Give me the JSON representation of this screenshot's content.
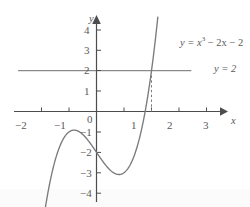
{
  "figure": {
    "background_color": "#ffffff",
    "ink_color": "#59595b",
    "curve_color": "#7b7b7d",
    "line_color": "#6e6e70"
  },
  "axes": {
    "x_axis_label": "x",
    "y_axis_label": "y",
    "x_ticks": [
      {
        "label": "−2",
        "value": -2
      },
      {
        "label": "−1",
        "value": -1
      },
      {
        "label": "1",
        "value": 1
      },
      {
        "label": "2",
        "value": 2
      },
      {
        "label": "3",
        "value": 3
      }
    ],
    "y_ticks": [
      {
        "label": "4",
        "value": 4
      },
      {
        "label": "3",
        "value": 3
      },
      {
        "label": "2",
        "value": 2
      },
      {
        "label": "1",
        "value": 1
      },
      {
        "label": "−1",
        "value": -1
      },
      {
        "label": "−2",
        "value": -2
      },
      {
        "label": "−3",
        "value": -3
      },
      {
        "label": "−4",
        "value": -4
      }
    ],
    "origin_label": "0",
    "xlim": [
      -2.45,
      3.45
    ],
    "ylim": [
      -4.45,
      4.6
    ]
  },
  "labels": {
    "cubic_lhs": "y = ",
    "cubic_base": "x",
    "cubic_exponent": "3",
    "cubic_rest": " − 2x − 2",
    "horizontal_line": "y = 2"
  },
  "chart_data": {
    "type": "line",
    "title": "",
    "xlabel": "x",
    "ylabel": "y",
    "xlim": [
      -2.45,
      3.45
    ],
    "ylim": [
      -4.45,
      4.6
    ],
    "grid": false,
    "legend": "inline-annotations",
    "series": [
      {
        "name": "y = x^3 - 2x - 2",
        "type": "cubic",
        "expression": "x**3 - 2*x - 2",
        "label": "y = x³ − 2x − 2",
        "domain": [
          -2.1,
          2.23
        ],
        "x": [
          -2.1,
          -2.0,
          -1.8,
          -1.6,
          -1.4,
          -1.2,
          -1.0,
          -0.8,
          -0.6,
          -0.4,
          -0.2,
          0.0,
          0.2,
          0.4,
          0.6,
          0.82,
          1.0,
          1.2,
          1.4,
          1.6,
          1.8,
          2.0,
          2.23
        ],
        "y": [
          -7.06,
          -6.0,
          -4.23,
          -2.9,
          -1.94,
          -1.33,
          -1.0,
          -0.91,
          -1.02,
          -1.26,
          -1.61,
          -2.0,
          -2.39,
          -2.74,
          -3.02,
          -3.09,
          -3.0,
          -2.67,
          -2.06,
          -1.1,
          0.23,
          2.0,
          4.62
        ],
        "local_max": {
          "x": -0.816,
          "y": -0.911
        },
        "local_min": {
          "x": 0.816,
          "y": -3.089
        },
        "x_intercept_shown_near": 1.77
      },
      {
        "name": "y = 2",
        "type": "horizontal-line",
        "label": "y = 2",
        "y_value": 2,
        "x_range": [
          -2.85,
          3.45
        ]
      }
    ],
    "annotations": [
      {
        "name": "intersection-dashed-dropline",
        "style": "dashed-vertical",
        "x": 2,
        "from_y": 2,
        "to_y": 0
      }
    ]
  }
}
